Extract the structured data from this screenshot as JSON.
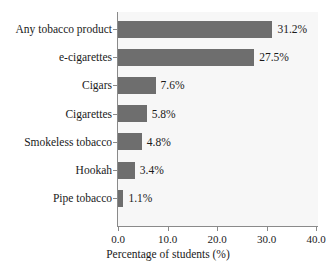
{
  "chart_data": {
    "type": "bar",
    "orientation": "horizontal",
    "title": "",
    "xlabel": "Percentage of students (%)",
    "ylabel": "",
    "xlim": [
      0.0,
      40.0
    ],
    "xticks": [
      "0.0",
      "10.0",
      "20.0",
      "30.0",
      "40.0"
    ],
    "xtick_values": [
      0.0,
      10.0,
      20.0,
      30.0,
      40.0
    ],
    "grid": false,
    "legend": "none",
    "categories": [
      "Any tobacco product",
      "e-cigarettes",
      "Cigars",
      "Cigarettes",
      "Smokeless tobacco",
      "Hookah",
      "Pipe tobacco"
    ],
    "values": [
      31.2,
      27.5,
      7.6,
      5.8,
      4.8,
      3.4,
      1.1
    ],
    "value_labels": [
      "31.2%",
      "27.5%",
      "7.6%",
      "5.8%",
      "4.8%",
      "3.4%",
      "1.1%"
    ],
    "bars": [
      {
        "category": "Any tobacco product",
        "value": 31.2,
        "label": "31.2%"
      },
      {
        "category": "e-cigarettes",
        "value": 27.5,
        "label": "27.5%"
      },
      {
        "category": "Cigars",
        "value": 7.6,
        "label": "7.6%"
      },
      {
        "category": "Cigarettes",
        "value": 5.8,
        "label": "5.8%"
      },
      {
        "category": "Smokeless tobacco",
        "value": 4.8,
        "label": "4.8%"
      },
      {
        "category": "Hookah",
        "value": 3.4,
        "label": "3.4%"
      },
      {
        "category": "Pipe tobacco",
        "value": 1.1,
        "label": "1.1%"
      }
    ],
    "colors": {
      "bar": "#6e6e6e",
      "plot_background": "#f7f7f7",
      "figure_background": "#ffffff",
      "axis": "#8a8a8a",
      "text": "#1a1a1a"
    }
  }
}
